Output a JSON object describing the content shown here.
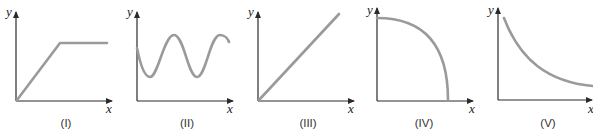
{
  "figure": {
    "panels": [
      {
        "id": "I",
        "caption": "(I)",
        "x_label": "x",
        "y_label": "y",
        "shape": "linear increase then constant",
        "color": "#9a9a9a"
      },
      {
        "id": "II",
        "caption": "(II)",
        "x_label": "x",
        "y_label": "y",
        "shape": "sinusoidal oscillation",
        "color": "#9a9a9a"
      },
      {
        "id": "III",
        "caption": "(III)",
        "x_label": "x",
        "y_label": "y",
        "shape": "straight line through origin",
        "color": "#9a9a9a"
      },
      {
        "id": "IV",
        "caption": "(IV)",
        "x_label": "x",
        "y_label": "y",
        "shape": "quarter circle decreasing",
        "color": "#9a9a9a"
      },
      {
        "id": "V",
        "caption": "(V)",
        "x_label": "x",
        "y_label": "y",
        "shape": "decaying curve",
        "color": "#9a9a9a"
      }
    ]
  }
}
